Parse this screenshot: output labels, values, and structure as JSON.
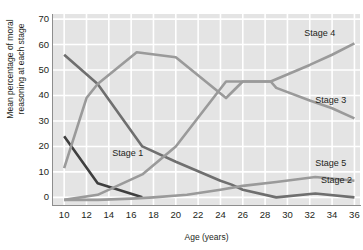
{
  "chart_data": {
    "type": "line",
    "title": "",
    "xlabel": "Age (years)",
    "ylabel": "Mean percentage of moral\nreasoning at each stage",
    "xlim": [
      9,
      36.5
    ],
    "ylim": [
      -3,
      72
    ],
    "xticks": [
      10,
      12,
      14,
      16,
      18,
      20,
      22,
      24,
      26,
      28,
      30,
      32,
      34,
      36
    ],
    "yticks": [
      0,
      10,
      20,
      30,
      40,
      50,
      60,
      70
    ],
    "grid": true,
    "grid_color": "#ffffff",
    "panel_color": "#e4e4e4",
    "legend": "inline-labels",
    "series": [
      {
        "name": "Stage 1",
        "color": "#3f3f3f",
        "label_x": 14.3,
        "label_y": 17,
        "x": [
          10,
          13,
          17
        ],
        "y": [
          24,
          5.5,
          0
        ]
      },
      {
        "name": "Stage 2",
        "color": "#6f6f6f",
        "label_x": 33.0,
        "label_y": 6.5,
        "x": [
          10,
          13,
          17,
          20,
          24,
          25,
          26,
          29,
          32.5,
          36
        ],
        "y": [
          56,
          44.5,
          20,
          14,
          6.5,
          5,
          3,
          0,
          1.5,
          0
        ]
      },
      {
        "name": "Stage 3",
        "color": "#9a9a9a",
        "label_x": 32.5,
        "label_y": 38,
        "x": [
          10,
          12,
          13,
          16.5,
          20,
          24.5,
          26,
          28.5,
          29,
          32,
          34,
          36
        ],
        "y": [
          11.5,
          39,
          44.5,
          57,
          55,
          39,
          45.5,
          45.5,
          43,
          38,
          35,
          31
        ]
      },
      {
        "name": "Stage 4",
        "color": "#9a9a9a",
        "label_x": 31.5,
        "label_y": 64,
        "x": [
          10,
          13,
          17,
          20,
          24.5,
          26,
          28.5,
          32,
          34,
          36
        ],
        "y": [
          -1,
          1,
          9,
          20,
          45.5,
          45.5,
          45.5,
          52,
          56,
          60.5
        ]
      },
      {
        "name": "Stage 5",
        "color": "#9a9a9a",
        "label_x": 32.5,
        "label_y": 13,
        "x": [
          10,
          13,
          16,
          18,
          21,
          24,
          26,
          29,
          32.5,
          36
        ],
        "y": [
          -1,
          -1,
          -0.5,
          0,
          1,
          3,
          4.5,
          6,
          8,
          6.5
        ]
      }
    ]
  }
}
